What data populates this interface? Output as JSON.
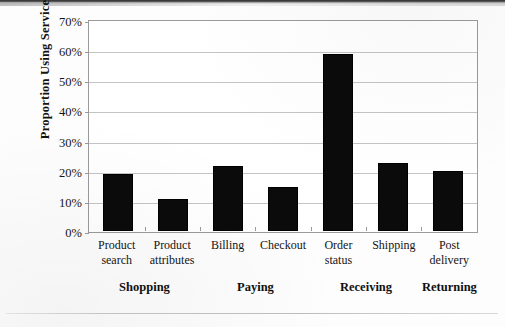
{
  "chart_data": {
    "type": "bar",
    "title": "",
    "subtitle": "",
    "xlabel": "",
    "ylabel": "Proportion Using Service",
    "ylim": [
      0,
      70
    ],
    "ytick_labels": [
      "70%",
      "60%",
      "50%",
      "40%",
      "30%",
      "20%",
      "10%",
      "0%"
    ],
    "ytick_values": [
      70,
      60,
      50,
      40,
      30,
      20,
      10,
      0
    ],
    "grid": true,
    "legend": null,
    "bar_color": "#0b0b0b",
    "frame_color": "#9a9a9a",
    "gridline_color": "#c4c4c4",
    "categories": [
      {
        "line1": "Product",
        "line2": "search"
      },
      {
        "line1": "Product",
        "line2": "attributes"
      },
      {
        "line1": "Billing",
        "line2": ""
      },
      {
        "line1": "Checkout",
        "line2": ""
      },
      {
        "line1": "Order",
        "line2": "status"
      },
      {
        "line1": "Shipping",
        "line2": ""
      },
      {
        "line1": "Post",
        "line2": "delivery"
      }
    ],
    "values": [
      19,
      10.5,
      21.5,
      14.5,
      58.7,
      22.7,
      19.8
    ],
    "groups": [
      {
        "label": "Shopping",
        "categories": [
          "Product search",
          "Product attributes"
        ],
        "center_pct": 14.3
      },
      {
        "label": "Paying",
        "categories": [
          "Billing",
          "Checkout"
        ],
        "center_pct": 42.9
      },
      {
        "label": "Receiving",
        "categories": [
          "Order status",
          "Shipping"
        ],
        "center_pct": 71.4
      },
      {
        "label": "Returning",
        "categories": [
          "Post delivery"
        ],
        "center_pct": 92.9
      }
    ]
  }
}
